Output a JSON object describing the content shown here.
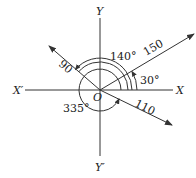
{
  "diagram": {
    "type": "vector-angles",
    "axes": {
      "x_pos": "X",
      "x_neg": "X′",
      "y_pos": "Y",
      "y_neg": "Y′",
      "origin": "O"
    },
    "vectors": [
      {
        "magnitude_label": "150",
        "angle_label": "30°",
        "angle_deg": 30
      },
      {
        "magnitude_label": "90",
        "angle_label": "140°",
        "angle_deg": 140
      },
      {
        "magnitude_label": "110",
        "angle_label": "335°",
        "angle_deg": 335
      }
    ],
    "colors": {
      "line": "#333333",
      "text": "#222222",
      "background": "#ffffff"
    }
  }
}
